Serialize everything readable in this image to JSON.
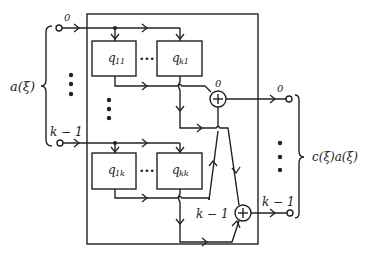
{
  "diagram": {
    "input_bus_label": "a(ξ)",
    "output_bus_label": "c(ξ)a(ξ)",
    "inputs": [
      {
        "label": "0"
      },
      {
        "label": "k − 1"
      }
    ],
    "outputs": [
      {
        "label": "0"
      },
      {
        "label": "k − 1"
      }
    ],
    "summers": [
      {
        "label": "0",
        "symbol": "+"
      },
      {
        "label": "k − 1",
        "symbol": "+"
      }
    ],
    "blocks": [
      {
        "name": "q",
        "sub": "11"
      },
      {
        "name": "q",
        "sub": "k1"
      },
      {
        "name": "q",
        "sub": "1k"
      },
      {
        "name": "q",
        "sub": "kk"
      }
    ],
    "ellipsis": "•••"
  }
}
